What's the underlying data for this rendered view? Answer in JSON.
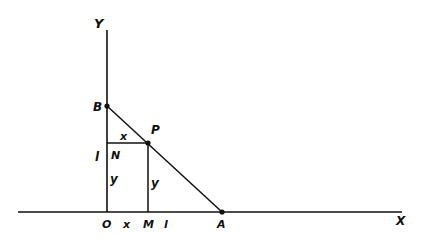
{
  "diagram": {
    "axes": {
      "x_label": "X",
      "y_label": "Y"
    },
    "points": {
      "origin": "O",
      "B": "B",
      "P": "P",
      "N": "N",
      "M": "M",
      "A": "A"
    },
    "segment_labels": {
      "NP": "x",
      "OM": "x",
      "BN": "l",
      "MA": "l",
      "ON": "y",
      "MP": "y"
    },
    "colors": {
      "ink": "#111111",
      "background": "#ffffff"
    }
  }
}
